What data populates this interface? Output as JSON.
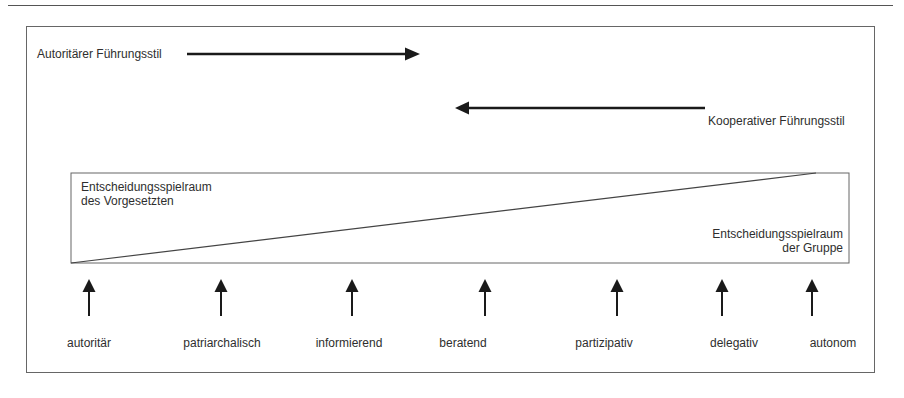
{
  "diagram": {
    "top_arrow": {
      "label": "Autoritärer Führungsstil",
      "direction": "right"
    },
    "bottom_arrow": {
      "label": "Kooperativer Führungsstil",
      "direction": "left"
    },
    "box": {
      "superior_label_line1": "Entscheidungsspielraum",
      "superior_label_line2": "des Vorgesetzten",
      "group_label_line1": "Entscheidungsspielraum",
      "group_label_line2": "der Gruppe"
    },
    "styles": [
      {
        "label": "autoritär",
        "arrow_x": 89,
        "label_x": 89
      },
      {
        "label": "patriarchalisch",
        "arrow_x": 221,
        "label_x": 222
      },
      {
        "label": "informierend",
        "arrow_x": 352,
        "label_x": 349
      },
      {
        "label": "beratend",
        "arrow_x": 485,
        "label_x": 463
      },
      {
        "label": "partizipativ",
        "arrow_x": 617,
        "label_x": 604
      },
      {
        "label": "delegativ",
        "arrow_x": 722,
        "label_x": 734
      },
      {
        "label": "autonom",
        "arrow_x": 812,
        "label_x": 833
      }
    ],
    "colors": {
      "line": "#1a1a1a",
      "frame": "#666666",
      "text": "#2e2e2e"
    }
  }
}
